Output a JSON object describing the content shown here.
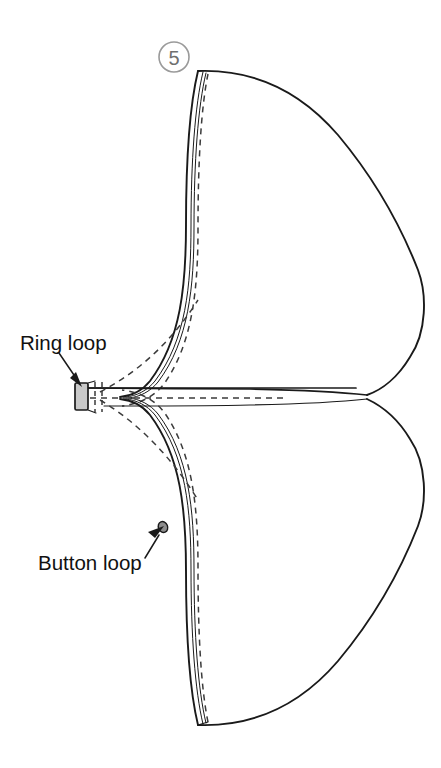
{
  "figure": {
    "step": {
      "number": "5",
      "shape": "circle",
      "color": "#6f6f6f",
      "cx": 174,
      "cy": 57,
      "r": 15
    },
    "background_color": "#ffffff",
    "line_color": "#1a1a1a",
    "stitch_color": "#3b3b3b",
    "tab_fill_color": "#c9c9c9"
  },
  "callouts": [
    {
      "id": "ring-loop",
      "label": "Ring loop",
      "text_x": 20,
      "text_y": 350,
      "leader": {
        "x1": 59,
        "y1": 353,
        "x2": 78,
        "y2": 380
      },
      "points_to": "ring-loop-tab"
    },
    {
      "id": "button-loop",
      "label": "Button loop",
      "text_x": 38,
      "text_y": 570,
      "leader": {
        "x1": 148,
        "y1": 556,
        "x2": 161,
        "y2": 531
      },
      "points_to": "button-loop-bump"
    }
  ],
  "parts": [
    {
      "id": "upper-panel",
      "name": "Upper wing panel",
      "description": "Large curved fabric panel above the centre seam"
    },
    {
      "id": "lower-panel",
      "name": "Lower wing panel",
      "description": "Large curved fabric panel below the centre seam"
    },
    {
      "id": "ring-loop-tab",
      "name": "Ring loop tab",
      "description": "Small shaded rectangular loop tab at the centre point"
    },
    {
      "id": "button-loop-bump",
      "name": "Button loop",
      "description": "Small loop on the lower panel fold edge"
    },
    {
      "id": "centre-seam-line",
      "name": "Centre seam line"
    },
    {
      "id": "centre-stitch-line",
      "name": "Centre stitching guide line"
    }
  ]
}
